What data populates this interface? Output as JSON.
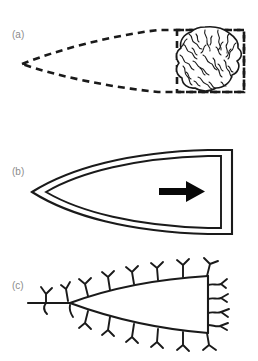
{
  "figure": {
    "width": 258,
    "height": 361,
    "background_color": "#ffffff",
    "stroke_color": "#1a1a1a",
    "label_color": "#8b8b8b",
    "panel_count": 3
  },
  "panels": [
    {
      "id": "a",
      "label": "(a)",
      "description": "dashed teardrop outline with convoluted blob inside dashed rectangle",
      "elements": [
        "dashed-teardrop-outline",
        "dashed-rectangle",
        "convoluted-blob"
      ]
    },
    {
      "id": "b",
      "label": "(b)",
      "description": "nested pointed contours with rightward arrow",
      "elements": [
        "outer-pointed-contour",
        "inner-pointed-contour",
        "direction-arrow"
      ]
    },
    {
      "id": "c",
      "label": "(c)",
      "description": "branching dendritic structure with Y-shaped branchlets",
      "elements": [
        "main-stem",
        "upper-branch",
        "lower-branch",
        "right-branch",
        "branchlets"
      ]
    }
  ]
}
